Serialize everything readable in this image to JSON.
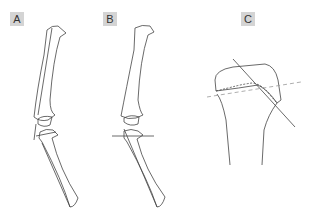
{
  "panels": [
    {
      "id": "A",
      "label": "A",
      "description": "Long bones in sagittal view with angled reference lines at knee joint"
    },
    {
      "id": "B",
      "label": "B",
      "description": "Long bones with horizontal reference line at proximal tibia"
    },
    {
      "id": "C",
      "label": "C",
      "description": "Close-up of proximal tibia growth plate with solid and dashed reference lines"
    }
  ],
  "colors": {
    "stroke": "#444444",
    "label_bg": "#d4d4d4",
    "dashed": "#999999"
  }
}
